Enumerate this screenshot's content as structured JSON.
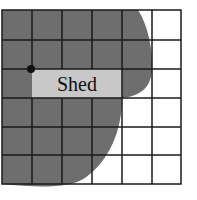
{
  "diagram": {
    "grid": {
      "cols": 6,
      "rows": 6,
      "x": 2,
      "y": 10,
      "cell": 29.8
    },
    "label": "Shed",
    "colors": {
      "region": "#6e6e6e",
      "shed": "#c8c8c8",
      "line": "#1a1a1a",
      "background": "#ffffff"
    }
  }
}
